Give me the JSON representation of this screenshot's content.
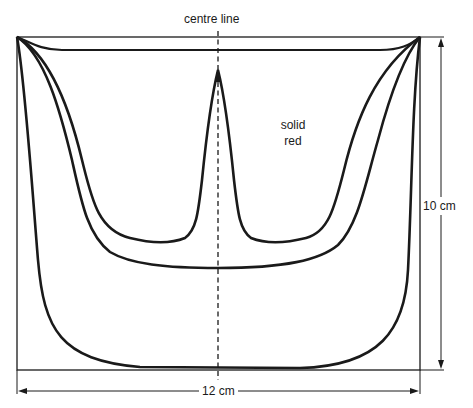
{
  "diagram": {
    "labels": {
      "centre_line": "centre line",
      "region_line1": "solid",
      "region_line2": "red",
      "height_dimension": "10 cm",
      "width_dimension": "12 cm"
    },
    "dimensions": {
      "width": "12 cm",
      "height": "10 cm"
    },
    "colors": {
      "stroke": "#1a1a1a",
      "background": "#ffffff"
    },
    "shapes": [
      "bounding-rectangle",
      "outer-u-curve",
      "middle-u-curve",
      "inner-trident-curve",
      "top-sweep-curve",
      "centre-line-dashed"
    ]
  }
}
